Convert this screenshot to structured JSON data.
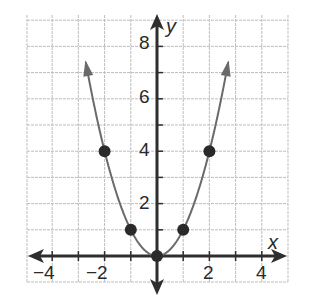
{
  "chart_data": {
    "type": "line",
    "title": "",
    "function": "y = x^2",
    "xlabel": "x",
    "ylabel": "y",
    "xlim": [
      -5,
      5
    ],
    "ylim": [
      -1,
      9
    ],
    "grid": true,
    "grid_step": 1,
    "x_tick_labels": [
      "-4",
      "-2",
      "2",
      "4"
    ],
    "x_ticks": [
      -4,
      -2,
      2,
      4
    ],
    "y_tick_labels": [
      "2",
      "4",
      "6",
      "8"
    ],
    "y_ticks": [
      2,
      4,
      6,
      8
    ],
    "series": [
      {
        "name": "parabola",
        "points": [
          {
            "x": -2,
            "y": 4
          },
          {
            "x": -1,
            "y": 1
          },
          {
            "x": 0,
            "y": 0
          },
          {
            "x": 1,
            "y": 1
          },
          {
            "x": 2,
            "y": 4
          }
        ],
        "arrows_at_ends": true
      }
    ],
    "colors": {
      "grid": "#bdbdbd",
      "axis": "#2e2e2e",
      "curve": "#6a6a6a",
      "points": "#2a2a2a"
    }
  },
  "labels": {
    "x_axis": "x",
    "y_axis": "y",
    "x_ticks": [
      "−4",
      "−2",
      "2",
      "4"
    ],
    "y_ticks": [
      "8",
      "6",
      "4",
      "2"
    ]
  }
}
